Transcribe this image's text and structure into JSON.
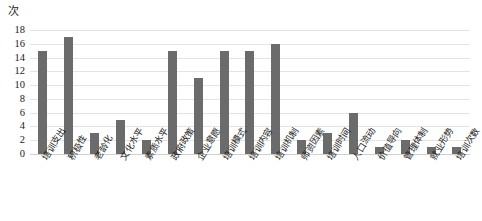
{
  "chart_data": {
    "type": "bar",
    "title": "",
    "subtitle": "",
    "xlabel": "",
    "ylabel": "次",
    "ylim": [
      0,
      18
    ],
    "ytick_step": 2,
    "yticks": [
      "0",
      "2",
      "4",
      "6",
      "8",
      "10",
      "12",
      "14",
      "16",
      "18"
    ],
    "grid": true,
    "legend": "none",
    "bar_color": "#6b6b6b",
    "gridline_color": "#e4e4e4",
    "categories": [
      "培训支出",
      "积极性",
      "老龄化",
      "文化水平",
      "素质水平",
      "政府政策",
      "企业意愿",
      "培训模式",
      "培训内容",
      "培训机制",
      "师资因素",
      "培训时间",
      "人口流动",
      "价值导向",
      "管理体制",
      "就业形势",
      "培训次数"
    ],
    "values": [
      15,
      17,
      3,
      5,
      2,
      15,
      11,
      15,
      15,
      16,
      2,
      3,
      6,
      1,
      2,
      1,
      1
    ],
    "series": [
      {
        "name": "频次",
        "values": [
          15,
          17,
          3,
          5,
          2,
          15,
          11,
          15,
          15,
          16,
          2,
          3,
          6,
          1,
          2,
          1,
          1
        ]
      }
    ]
  }
}
